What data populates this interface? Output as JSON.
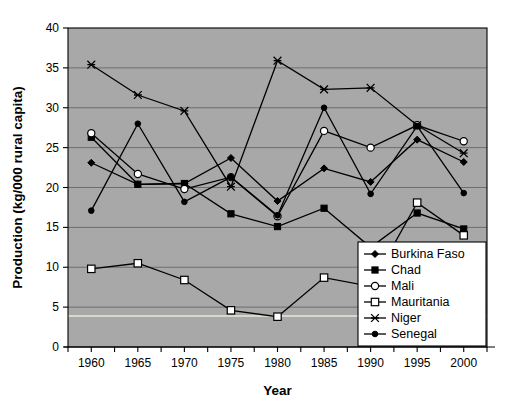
{
  "chart_data": {
    "type": "line",
    "title": "",
    "xlabel": "Year",
    "ylabel": "Production (kg/000 rural capita)",
    "x": [
      1960,
      1965,
      1970,
      1975,
      1980,
      1985,
      1990,
      1995,
      2000
    ],
    "xtick_labels": [
      "1960",
      "1965",
      "1970",
      "1975",
      "1980",
      "1985",
      "1990",
      "1995",
      "2000"
    ],
    "ytick_labels": [
      "0",
      "5",
      "10",
      "15",
      "20",
      "25",
      "30",
      "35",
      "40"
    ],
    "ytick_values": [
      0,
      5,
      10,
      15,
      20,
      25,
      30,
      35,
      40
    ],
    "xlim": [
      1957.5,
      2002.5
    ],
    "ylim": [
      0,
      40
    ],
    "grid": "horizontal",
    "legend_position": "bottom-right",
    "plot_background": "#a8a8a8",
    "line_color": "#000000",
    "series": [
      {
        "name": "Burkina Faso",
        "marker": "diamond-filled",
        "values": [
          23.1,
          20.4,
          20.5,
          23.7,
          18.3,
          22.4,
          20.7,
          26.0,
          23.2
        ]
      },
      {
        "name": "Chad",
        "marker": "square-filled",
        "values": [
          26.3,
          20.4,
          20.5,
          16.7,
          15.1,
          17.4,
          12.5,
          16.8,
          14.8
        ]
      },
      {
        "name": "Mali",
        "marker": "circle-hollow",
        "values": [
          26.8,
          21.7,
          19.8,
          21.3,
          16.4,
          27.1,
          25.0,
          27.8,
          25.8
        ]
      },
      {
        "name": "Mauritania",
        "marker": "square-hollow",
        "values": [
          9.8,
          10.5,
          8.4,
          4.6,
          3.8,
          8.7,
          7.6,
          18.1,
          14.0
        ]
      },
      {
        "name": "Niger",
        "marker": "asterisk",
        "values": [
          35.4,
          31.6,
          29.6,
          20.1,
          35.9,
          32.3,
          32.5,
          27.8,
          24.3
        ]
      },
      {
        "name": "Senegal",
        "marker": "circle-filled",
        "values": [
          17.1,
          28.0,
          18.2,
          21.3,
          16.5,
          30.0,
          19.2,
          27.7,
          19.3
        ]
      }
    ]
  }
}
